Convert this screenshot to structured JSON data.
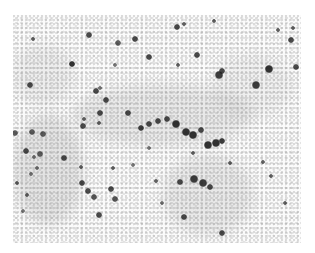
{
  "image": {
    "description": "Grayscale microscopy / histology field with scattered dark stained cells on a light speckled background",
    "frame": {
      "x": 13,
      "y": 15,
      "width": 288,
      "height": 228
    }
  },
  "shading_regions": [
    {
      "x": 0,
      "y": 100,
      "w": 70,
      "h": 110,
      "o": 0.18
    },
    {
      "x": 60,
      "y": 70,
      "w": 180,
      "h": 60,
      "o": 0.14
    },
    {
      "x": 150,
      "y": 140,
      "w": 90,
      "h": 80,
      "o": 0.14
    },
    {
      "x": 0,
      "y": 30,
      "w": 60,
      "h": 60,
      "o": 0.1
    },
    {
      "x": 200,
      "y": 40,
      "w": 80,
      "h": 60,
      "o": 0.08
    }
  ],
  "cells": [
    {
      "x": 20,
      "y": 24,
      "r": 2,
      "o": 0.7
    },
    {
      "x": 76,
      "y": 20,
      "r": 3,
      "o": 0.8
    },
    {
      "x": 105,
      "y": 28,
      "r": 3,
      "o": 0.7
    },
    {
      "x": 122,
      "y": 24,
      "r": 3,
      "o": 0.8
    },
    {
      "x": 136,
      "y": 42,
      "r": 3,
      "o": 0.8
    },
    {
      "x": 59,
      "y": 49,
      "r": 3,
      "o": 0.9
    },
    {
      "x": 17,
      "y": 70,
      "r": 3,
      "o": 0.8
    },
    {
      "x": 102,
      "y": 50,
      "r": 2,
      "o": 0.6
    },
    {
      "x": 83,
      "y": 76,
      "r": 3,
      "o": 0.8
    },
    {
      "x": 93,
      "y": 85,
      "r": 3,
      "o": 0.8
    },
    {
      "x": 87,
      "y": 98,
      "r": 3,
      "o": 0.8
    },
    {
      "x": 115,
      "y": 98,
      "r": 3,
      "o": 0.8
    },
    {
      "x": 86,
      "y": 108,
      "r": 2,
      "o": 0.7
    },
    {
      "x": 71,
      "y": 104,
      "r": 2,
      "o": 0.7
    },
    {
      "x": 87,
      "y": 73,
      "r": 2,
      "o": 0.6
    },
    {
      "x": 164,
      "y": 12,
      "r": 3,
      "o": 0.8
    },
    {
      "x": 171,
      "y": 9,
      "r": 2,
      "o": 0.7
    },
    {
      "x": 201,
      "y": 6,
      "r": 2,
      "o": 0.7
    },
    {
      "x": 265,
      "y": 15,
      "r": 2,
      "o": 0.7
    },
    {
      "x": 280,
      "y": 13,
      "r": 2,
      "o": 0.7
    },
    {
      "x": 278,
      "y": 25,
      "r": 3,
      "o": 0.8
    },
    {
      "x": 184,
      "y": 40,
      "r": 3,
      "o": 0.8
    },
    {
      "x": 165,
      "y": 50,
      "r": 2,
      "o": 0.7
    },
    {
      "x": 209,
      "y": 56,
      "r": 3,
      "o": 0.8
    },
    {
      "x": 206,
      "y": 60,
      "r": 4,
      "o": 0.85
    },
    {
      "x": 256,
      "y": 54,
      "r": 4,
      "o": 0.9
    },
    {
      "x": 243,
      "y": 70,
      "r": 4,
      "o": 0.85
    },
    {
      "x": 283,
      "y": 52,
      "r": 3,
      "o": 0.8
    },
    {
      "x": 2,
      "y": 118,
      "r": 3,
      "o": 0.7
    },
    {
      "x": 13,
      "y": 136,
      "r": 3,
      "o": 0.8
    },
    {
      "x": 27,
      "y": 139,
      "r": 3,
      "o": 0.7
    },
    {
      "x": 19,
      "y": 117,
      "r": 3,
      "o": 0.7
    },
    {
      "x": 30,
      "y": 119,
      "r": 3,
      "o": 0.7
    },
    {
      "x": 51,
      "y": 143,
      "r": 3,
      "o": 0.8
    },
    {
      "x": 70,
      "y": 111,
      "r": 3,
      "o": 0.8
    },
    {
      "x": 128,
      "y": 113,
      "r": 3,
      "o": 0.85
    },
    {
      "x": 136,
      "y": 109,
      "r": 3,
      "o": 0.8
    },
    {
      "x": 145,
      "y": 106,
      "r": 3,
      "o": 0.8
    },
    {
      "x": 154,
      "y": 104,
      "r": 3,
      "o": 0.8
    },
    {
      "x": 163,
      "y": 109,
      "r": 4,
      "o": 0.9
    },
    {
      "x": 173,
      "y": 117,
      "r": 4,
      "o": 0.9
    },
    {
      "x": 180,
      "y": 120,
      "r": 4,
      "o": 0.9
    },
    {
      "x": 188,
      "y": 115,
      "r": 3,
      "o": 0.8
    },
    {
      "x": 195,
      "y": 130,
      "r": 4,
      "o": 0.9
    },
    {
      "x": 203,
      "y": 128,
      "r": 4,
      "o": 0.9
    },
    {
      "x": 209,
      "y": 126,
      "r": 3,
      "o": 0.85
    },
    {
      "x": 136,
      "y": 133,
      "r": 2,
      "o": 0.6
    },
    {
      "x": 21,
      "y": 142,
      "r": 2,
      "o": 0.6
    },
    {
      "x": 4,
      "y": 168,
      "r": 2,
      "o": 0.7
    },
    {
      "x": 18,
      "y": 159,
      "r": 2,
      "o": 0.6
    },
    {
      "x": 14,
      "y": 180,
      "r": 2,
      "o": 0.7
    },
    {
      "x": 24,
      "y": 153,
      "r": 2,
      "o": 0.6
    },
    {
      "x": 69,
      "y": 168,
      "r": 3,
      "o": 0.8
    },
    {
      "x": 75,
      "y": 176,
      "r": 3,
      "o": 0.8
    },
    {
      "x": 81,
      "y": 182,
      "r": 3,
      "o": 0.75
    },
    {
      "x": 98,
      "y": 174,
      "r": 3,
      "o": 0.8
    },
    {
      "x": 102,
      "y": 184,
      "r": 3,
      "o": 0.75
    },
    {
      "x": 86,
      "y": 200,
      "r": 3,
      "o": 0.8
    },
    {
      "x": 68,
      "y": 152,
      "r": 2,
      "o": 0.7
    },
    {
      "x": 100,
      "y": 153,
      "r": 2,
      "o": 0.7
    },
    {
      "x": 120,
      "y": 150,
      "r": 2,
      "o": 0.6
    },
    {
      "x": 143,
      "y": 166,
      "r": 2,
      "o": 0.7
    },
    {
      "x": 167,
      "y": 167,
      "r": 3,
      "o": 0.8
    },
    {
      "x": 181,
      "y": 164,
      "r": 4,
      "o": 0.85
    },
    {
      "x": 190,
      "y": 168,
      "r": 4,
      "o": 0.85
    },
    {
      "x": 197,
      "y": 172,
      "r": 3,
      "o": 0.8
    },
    {
      "x": 180,
      "y": 138,
      "r": 2,
      "o": 0.7
    },
    {
      "x": 171,
      "y": 202,
      "r": 3,
      "o": 0.8
    },
    {
      "x": 217,
      "y": 148,
      "r": 2,
      "o": 0.7
    },
    {
      "x": 250,
      "y": 147,
      "r": 2,
      "o": 0.7
    },
    {
      "x": 258,
      "y": 161,
      "r": 2,
      "o": 0.7
    },
    {
      "x": 272,
      "y": 188,
      "r": 2,
      "o": 0.7
    },
    {
      "x": 149,
      "y": 188,
      "r": 2,
      "o": 0.6
    },
    {
      "x": 10,
      "y": 196,
      "r": 2,
      "o": 0.6
    },
    {
      "x": 209,
      "y": 218,
      "r": 3,
      "o": 0.8
    }
  ],
  "colors": {
    "background": "#ffffff",
    "tissue": "#fbfbfb",
    "stain": "#2a2a2a"
  }
}
